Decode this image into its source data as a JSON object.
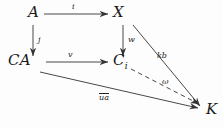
{
  "diagram": {
    "type": "commutative-diagram",
    "background_color": "#fdfdfd",
    "stroke_color": "#333333",
    "text_color": "#1a1a1a",
    "nodes": [
      {
        "id": "A",
        "label": "A",
        "sub": "",
        "x": 28,
        "y": 18
      },
      {
        "id": "X",
        "label": "X",
        "sub": "",
        "x": 118,
        "y": 18
      },
      {
        "id": "CA",
        "label": "CA",
        "sub": "",
        "x": 24,
        "y": 66
      },
      {
        "id": "Ci",
        "label": "C",
        "sub": "i",
        "x": 118,
        "y": 66
      },
      {
        "id": "K",
        "label": "K",
        "sub": "",
        "x": 206,
        "y": 113
      }
    ],
    "edges": [
      {
        "id": "A-X",
        "from": "A",
        "to": "X",
        "label": "i",
        "style": "solid",
        "label_x": 72,
        "label_y": 6
      },
      {
        "id": "A-CA",
        "from": "A",
        "to": "CA",
        "label": "j",
        "style": "solid",
        "label_x": 26,
        "label_y": 40
      },
      {
        "id": "X-Ci",
        "from": "X",
        "to": "Ci",
        "label": "w",
        "style": "solid",
        "label_x": 121,
        "label_y": 40
      },
      {
        "id": "CA-Ci",
        "from": "CA",
        "to": "Ci",
        "label": "v",
        "style": "solid",
        "label_x": 68,
        "label_y": 54
      },
      {
        "id": "X-K",
        "from": "X",
        "to": "K",
        "label": "kb",
        "style": "solid",
        "label_x": 160,
        "label_y": 54
      },
      {
        "id": "Ci-K",
        "from": "Ci",
        "to": "K",
        "label": "ω",
        "style": "dashed",
        "label_x": 163,
        "label_y": 79
      },
      {
        "id": "CA-K",
        "from": "CA",
        "to": "K",
        "label": "ua",
        "style": "solid",
        "label_x": 100,
        "label_y": 93,
        "overline": true
      }
    ]
  }
}
